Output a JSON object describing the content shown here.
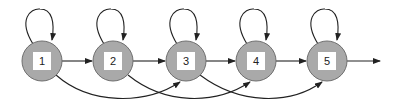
{
  "diagram": {
    "type": "state-transition",
    "colors": {
      "node_fill": "#a9a9a9",
      "node_stroke": "#6f6f6f",
      "box_fill": "#ffffff",
      "edge": "#222222"
    },
    "nodes": [
      {
        "id": "1",
        "label": "1"
      },
      {
        "id": "2",
        "label": "2"
      },
      {
        "id": "3",
        "label": "3"
      },
      {
        "id": "4",
        "label": "4"
      },
      {
        "id": "5",
        "label": "5"
      }
    ],
    "edges": [
      {
        "from": "1",
        "to": "1",
        "kind": "self-loop"
      },
      {
        "from": "2",
        "to": "2",
        "kind": "self-loop"
      },
      {
        "from": "3",
        "to": "3",
        "kind": "self-loop"
      },
      {
        "from": "4",
        "to": "4",
        "kind": "self-loop"
      },
      {
        "from": "5",
        "to": "5",
        "kind": "self-loop"
      },
      {
        "from": "1",
        "to": "2",
        "kind": "straight"
      },
      {
        "from": "2",
        "to": "3",
        "kind": "straight"
      },
      {
        "from": "3",
        "to": "4",
        "kind": "straight"
      },
      {
        "from": "4",
        "to": "5",
        "kind": "straight"
      },
      {
        "from": "5",
        "to": "exit",
        "kind": "straight"
      },
      {
        "from": "1",
        "to": "3",
        "kind": "skip-arc"
      },
      {
        "from": "2",
        "to": "4",
        "kind": "skip-arc"
      },
      {
        "from": "3",
        "to": "5",
        "kind": "skip-arc"
      }
    ]
  }
}
